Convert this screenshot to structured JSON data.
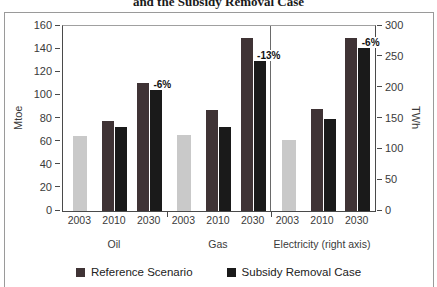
{
  "title_fragment": "and the Subsidy Removal Case",
  "chart_data": {
    "type": "bar",
    "title": "and the Subsidy Removal Case",
    "left_axis": {
      "label": "Mtoe",
      "min": 0,
      "max": 160,
      "ticks": [
        160,
        140,
        120,
        100,
        80,
        60,
        40,
        20,
        0
      ]
    },
    "right_axis": {
      "label": "TWh",
      "min": 0,
      "max": 300,
      "ticks": [
        300,
        250,
        200,
        150,
        100,
        50,
        0
      ]
    },
    "colors": {
      "actual": "#c9c9c9",
      "reference": "#3f3335",
      "subsidy": "#1a1a1a"
    },
    "legend": [
      {
        "name": "Reference Scenario",
        "color_key": "reference"
      },
      {
        "name": "Subsidy Removal Case",
        "color_key": "subsidy"
      }
    ],
    "sections": [
      {
        "label": "Oil",
        "axis": "left",
        "unit": "Mtoe",
        "divided": false,
        "groups": [
          {
            "year": "2003",
            "bars": [
              {
                "series": "2003",
                "color_key": "actual",
                "value": 65,
                "width": 14
              }
            ]
          },
          {
            "year": "2010",
            "bars": [
              {
                "series": "Reference Scenario",
                "color_key": "reference",
                "value": 78,
                "width": 12
              },
              {
                "series": "Subsidy Removal Case",
                "color_key": "subsidy",
                "value": 73,
                "width": 12
              }
            ]
          },
          {
            "year": "2030",
            "bars": [
              {
                "series": "Reference Scenario",
                "color_key": "reference",
                "value": 111,
                "width": 12
              },
              {
                "series": "Subsidy Removal Case",
                "color_key": "subsidy",
                "value": 105,
                "width": 12
              }
            ],
            "annotation": "-6%"
          }
        ]
      },
      {
        "label": "Gas",
        "axis": "left",
        "unit": "Mtoe",
        "divided": false,
        "groups": [
          {
            "year": "2003",
            "bars": [
              {
                "series": "2003",
                "color_key": "actual",
                "value": 66,
                "width": 14
              }
            ]
          },
          {
            "year": "2010",
            "bars": [
              {
                "series": "Reference Scenario",
                "color_key": "reference",
                "value": 87,
                "width": 12
              },
              {
                "series": "Subsidy Removal Case",
                "color_key": "subsidy",
                "value": 73,
                "width": 12
              }
            ]
          },
          {
            "year": "2030",
            "bars": [
              {
                "series": "Reference Scenario",
                "color_key": "reference",
                "value": 150,
                "width": 12
              },
              {
                "series": "Subsidy Removal Case",
                "color_key": "subsidy",
                "value": 130,
                "width": 12
              }
            ],
            "annotation": "-13%"
          }
        ]
      },
      {
        "label": "Electricity (right axis)",
        "axis": "right",
        "unit": "TWh",
        "divided": true,
        "groups": [
          {
            "year": "2003",
            "bars": [
              {
                "series": "2003",
                "color_key": "actual",
                "value": 115,
                "width": 14
              }
            ]
          },
          {
            "year": "2010",
            "bars": [
              {
                "series": "Reference Scenario",
                "color_key": "reference",
                "value": 165,
                "width": 12
              },
              {
                "series": "Subsidy Removal Case",
                "color_key": "subsidy",
                "value": 150,
                "width": 12
              }
            ]
          },
          {
            "year": "2030",
            "bars": [
              {
                "series": "Reference Scenario",
                "color_key": "reference",
                "value": 280,
                "width": 12
              },
              {
                "series": "Subsidy Removal Case",
                "color_key": "subsidy",
                "value": 265,
                "width": 12
              }
            ],
            "annotation": "-6%"
          }
        ]
      }
    ]
  }
}
